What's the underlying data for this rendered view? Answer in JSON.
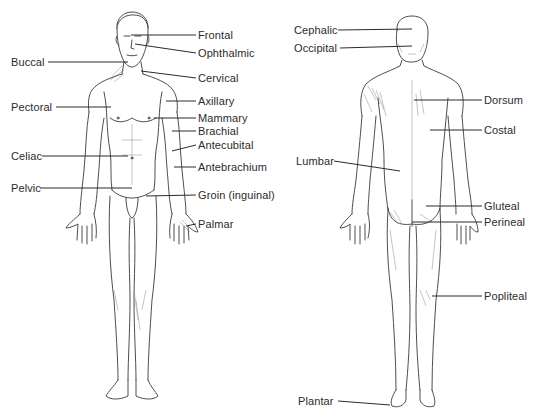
{
  "diagram": {
    "views": [
      {
        "id": "anterior",
        "label": "Anterior view"
      },
      {
        "id": "posterior",
        "label": "Posterior view"
      }
    ],
    "anterior_labels": [
      {
        "text": "Frontal",
        "x": 198,
        "y": 30
      },
      {
        "text": "Ophthalmic",
        "x": 198,
        "y": 47
      },
      {
        "text": "Buccal",
        "x": 10,
        "y": 56
      },
      {
        "text": "Cervical",
        "x": 198,
        "y": 73
      },
      {
        "text": "Pectoral",
        "x": 10,
        "y": 102
      },
      {
        "text": "Axillary",
        "x": 198,
        "y": 95
      },
      {
        "text": "Mammary",
        "x": 198,
        "y": 112
      },
      {
        "text": "Brachial",
        "x": 198,
        "y": 126
      },
      {
        "text": "Antecubital",
        "x": 198,
        "y": 140
      },
      {
        "text": "Celiac",
        "x": 10,
        "y": 150
      },
      {
        "text": "Antebrachium",
        "x": 198,
        "y": 162
      },
      {
        "text": "Pelvic",
        "x": 10,
        "y": 182
      },
      {
        "text": "Groin (inguinal)",
        "x": 198,
        "y": 189
      },
      {
        "text": "Palmar",
        "x": 198,
        "y": 218
      }
    ],
    "posterior_labels": [
      {
        "text": "Cephalic",
        "x": 294,
        "y": 24
      },
      {
        "text": "Occipital",
        "x": 294,
        "y": 42
      },
      {
        "text": "Dorsum",
        "x": 484,
        "y": 95
      },
      {
        "text": "Costal",
        "x": 484,
        "y": 124
      },
      {
        "text": "Lumbar",
        "x": 296,
        "y": 155
      },
      {
        "text": "Gluteal",
        "x": 484,
        "y": 200
      },
      {
        "text": "Perineal",
        "x": 484,
        "y": 217
      },
      {
        "text": "Popliteal",
        "x": 484,
        "y": 290
      },
      {
        "text": "Plantar",
        "x": 298,
        "y": 395
      }
    ]
  }
}
